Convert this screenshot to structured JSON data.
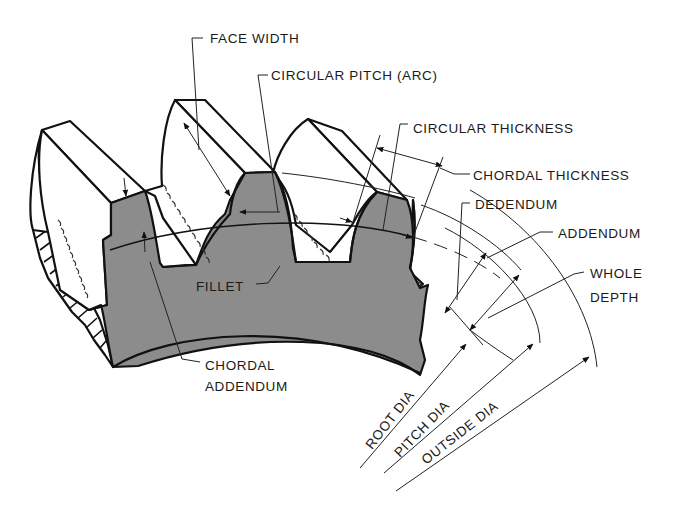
{
  "figure": {
    "fill_color": "#8c8c8c",
    "line_color": "#111111",
    "background": "#ffffff"
  },
  "labels": {
    "face_width": "FACE WIDTH",
    "circular_pitch": "CIRCULAR PITCH (ARC)",
    "circular_thickness": "CIRCULAR THICKNESS",
    "chordal_thickness": "CHORDAL THICKNESS",
    "dedendum": "DEDENDUM",
    "addendum": "ADDENDUM",
    "whole_depth_line1": "WHOLE",
    "whole_depth_line2": "DEPTH",
    "fillet": "FILLET",
    "chordal_addendum_line1": "CHORDAL",
    "chordal_addendum_line2": "ADDENDUM",
    "root_dia": "ROOT DIA",
    "pitch_dia": "PITCH DIA",
    "outside_dia": "OUTSIDE DIA"
  }
}
